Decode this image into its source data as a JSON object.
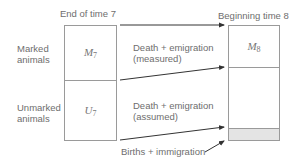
{
  "headers": {
    "left": "End of time 7",
    "right": "Beginning time 8"
  },
  "row_labels": {
    "marked": [
      "Marked",
      "animals"
    ],
    "unmarked": [
      "Unmarked",
      "animals"
    ]
  },
  "left_box": {
    "top": {
      "symbol": "M",
      "subscript": "7"
    },
    "bottom": {
      "symbol": "U",
      "subscript": "7"
    }
  },
  "right_box": {
    "top": {
      "symbol": "M",
      "subscript": "8"
    },
    "births_band_color": "#e4e4e4"
  },
  "flows": {
    "marked_loss": [
      "Death + emigration",
      "(measured)"
    ],
    "unmarked_loss": [
      "Death + emigration",
      "(assumed)"
    ],
    "gain": "Births + immigration"
  },
  "colors": {
    "line": "#9a9a9a",
    "arrow": "#333333",
    "text": "#6e6e6e"
  }
}
